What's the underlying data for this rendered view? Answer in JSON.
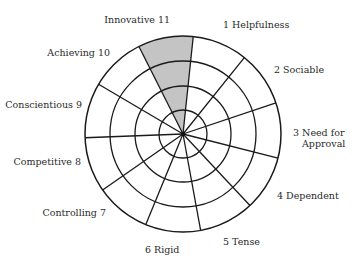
{
  "diagram": {
    "type": "polar-sector-grid",
    "center": [
      183,
      134
    ],
    "ring_radii": [
      24,
      48,
      73,
      98
    ],
    "sector_count": 11,
    "start_angle_deg": -84,
    "line_color": "#1a1a1a",
    "shade_color": "#c4c4c4",
    "highlighted_sector": {
      "index": 10,
      "label": "Achieving",
      "number": "10"
    },
    "labels": [
      {
        "id": "helpfulness",
        "number": "1",
        "text": "Helpfulness",
        "display": "1  Helpfulness",
        "x": 223,
        "y": 28,
        "anchor": "start"
      },
      {
        "id": "sociable",
        "number": "2",
        "text": "Sociable",
        "display": "2  Sociable",
        "x": 274,
        "y": 73,
        "anchor": "start"
      },
      {
        "id": "need-for-approval",
        "number": "3",
        "text": "Need for Approval",
        "display_line1": "3  Need for",
        "display_line2": "Approval",
        "x": 293,
        "y": 136,
        "anchor": "start"
      },
      {
        "id": "dependent",
        "number": "4",
        "text": "Dependent",
        "display": "4  Dependent",
        "x": 277,
        "y": 199,
        "anchor": "start"
      },
      {
        "id": "tense",
        "number": "5",
        "text": "Tense",
        "display": "5  Tense",
        "x": 223,
        "y": 245,
        "anchor": "start"
      },
      {
        "id": "rigid",
        "number": "6",
        "text": "Rigid",
        "display": "6  Rigid",
        "x": 145,
        "y": 253,
        "anchor": "start"
      },
      {
        "id": "controlling",
        "number": "7",
        "text": "Controlling",
        "display": "Controlling  7",
        "x": 106,
        "y": 216,
        "anchor": "end"
      },
      {
        "id": "competitive",
        "number": "8",
        "text": "Competitive",
        "display": "Competitive  8",
        "x": 81,
        "y": 165,
        "anchor": "end"
      },
      {
        "id": "conscientious",
        "number": "9",
        "text": "Conscientious",
        "display": "Conscientious  9",
        "x": 82,
        "y": 108,
        "anchor": "end"
      },
      {
        "id": "achieving",
        "number": "10",
        "text": "Achieving",
        "display": "Achieving  10",
        "x": 110,
        "y": 56,
        "anchor": "end"
      },
      {
        "id": "innovative",
        "number": "11",
        "text": "Innovative",
        "display": "Innovative  11",
        "x": 170,
        "y": 23,
        "anchor": "end"
      }
    ]
  }
}
